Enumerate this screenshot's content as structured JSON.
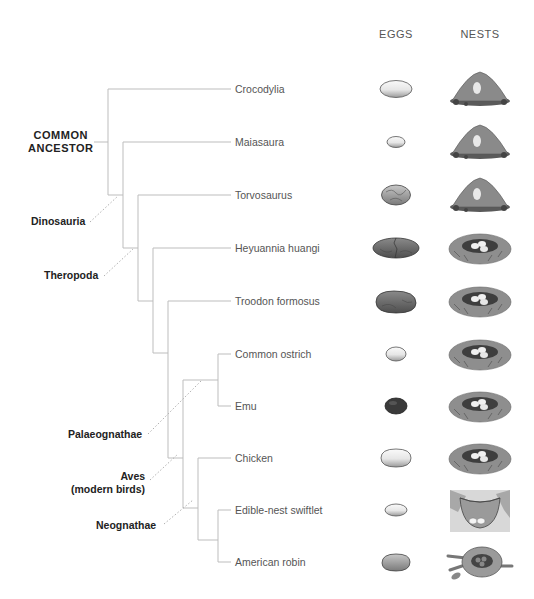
{
  "headers": {
    "eggs": "EGGS",
    "nests": "NESTS"
  },
  "colors": {
    "branch": "#bdbdbd",
    "dotted": "#b0b0b0",
    "egg_white": "#f2f2f2",
    "egg_gray": "#9a9a9a",
    "egg_dark": "#6e6e6e",
    "egg_black": "#3a3a3a",
    "mound": "#8a8a8a",
    "nest": "#9c9c9c"
  },
  "clades": {
    "common_ancestor": {
      "line1": "COMMON",
      "line2": "ANCESTOR"
    },
    "dinosauria": "Dinosauria",
    "theropoda": "Theropoda",
    "palaeognathae": "Palaeognathae",
    "aves": {
      "line1": "Aves",
      "line2": "(modern birds)"
    },
    "neognathae": "Neognathae"
  },
  "taxa": [
    {
      "name": "Crocodylia",
      "y": 89,
      "egg": "white-large-oval",
      "nest": "mound"
    },
    {
      "name": "Maiasaura",
      "y": 142,
      "egg": "white-small-oval",
      "nest": "mound"
    },
    {
      "name": "Torvosaurus",
      "y": 195,
      "egg": "gray-cracked-round",
      "nest": "mound"
    },
    {
      "name": "Heyuannia huangi",
      "y": 248,
      "egg": "dark-elongated-cracked",
      "nest": "bowl-with-eggs"
    },
    {
      "name": "Troodon formosus",
      "y": 301,
      "egg": "dark-elongated",
      "nest": "bowl-with-eggs"
    },
    {
      "name": "Common ostrich",
      "y": 354,
      "egg": "white-small-oval",
      "nest": "bowl-with-eggs"
    },
    {
      "name": "Emu",
      "y": 406,
      "egg": "black-oval",
      "nest": "bowl-with-eggs"
    },
    {
      "name": "Chicken",
      "y": 458,
      "egg": "white-oval",
      "nest": "bowl-with-eggs"
    },
    {
      "name": "Edible-nest swiftlet",
      "y": 510,
      "egg": "white-small-oval",
      "nest": "cup-on-wall"
    },
    {
      "name": "American robin",
      "y": 562,
      "egg": "gray-oval",
      "nest": "twig-nest"
    }
  ]
}
